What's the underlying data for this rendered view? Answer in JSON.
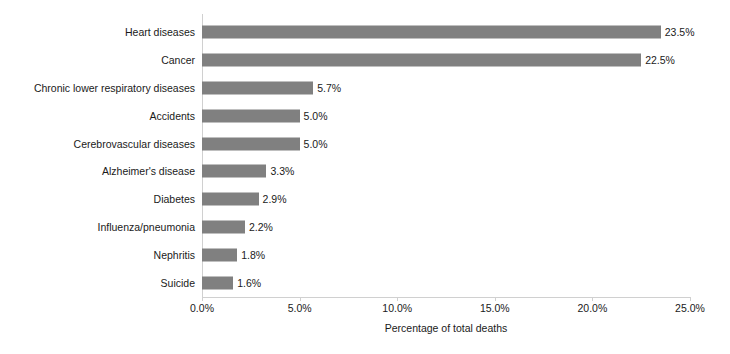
{
  "chart_data": {
    "type": "bar",
    "orientation": "horizontal",
    "title": "",
    "xlabel": "Percentage of total deaths",
    "ylabel": "",
    "xlim": [
      0,
      25
    ],
    "grid": false,
    "legend": null,
    "bar_color": "#808080",
    "axis_color": "#d0d0d0",
    "text_color": "#1a1a1a",
    "xticks": [
      "0.0%",
      "5.0%",
      "10.0%",
      "15.0%",
      "20.0%",
      "25.0%"
    ],
    "xtick_values": [
      0,
      5,
      10,
      15,
      20,
      25
    ],
    "categories": [
      "Heart diseases",
      "Cancer",
      "Chronic lower respiratory diseases",
      "Accidents",
      "Cerebrovascular diseases",
      "Alzheimer's disease",
      "Diabetes",
      "Influenza/pneumonia",
      "Nephritis",
      "Suicide"
    ],
    "values": [
      23.5,
      22.5,
      5.7,
      5.0,
      5.0,
      3.3,
      2.9,
      2.2,
      1.8,
      1.6
    ],
    "data_labels": [
      "23.5%",
      "22.5%",
      "5.7%",
      "5.0%",
      "5.0%",
      "3.3%",
      "2.9%",
      "2.2%",
      "1.8%",
      "1.6%"
    ]
  }
}
